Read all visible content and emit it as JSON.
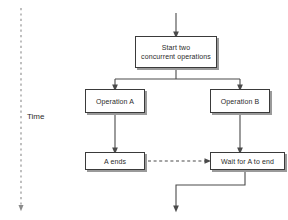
{
  "diagram": {
    "background_color": "#ffffff",
    "line_color": "#4a4a4a",
    "box_border_color": "#3a3a3a",
    "box_fill_color": "#ffffff",
    "shadow_color": "#9a9a9a",
    "text_color": "#2b2b2b",
    "axis": {
      "label": "Time",
      "direction": "downward",
      "style": "dashed-arrow"
    },
    "nodes": [
      {
        "id": "start",
        "label": "Start two\nconcurrent operations",
        "line1": "Start two",
        "line2": "concurrent operations"
      },
      {
        "id": "op_a",
        "label": "Operation A"
      },
      {
        "id": "op_b",
        "label": "Operation B"
      },
      {
        "id": "a_ends",
        "label": "A ends"
      },
      {
        "id": "wait",
        "label": "Wait for A to end"
      }
    ],
    "edges": [
      {
        "from": "entry",
        "to": "start",
        "style": "solid",
        "arrow": true
      },
      {
        "from": "start",
        "to": "op_a",
        "style": "solid",
        "arrow": true
      },
      {
        "from": "start",
        "to": "op_b",
        "style": "solid",
        "arrow": true
      },
      {
        "from": "op_a",
        "to": "a_ends",
        "style": "solid",
        "arrow": true
      },
      {
        "from": "op_b",
        "to": "wait",
        "style": "solid",
        "arrow": true
      },
      {
        "from": "a_ends",
        "to": "wait",
        "style": "dashed",
        "arrow": true
      },
      {
        "from": "wait",
        "to": "exit",
        "style": "solid",
        "arrow": true
      }
    ]
  }
}
